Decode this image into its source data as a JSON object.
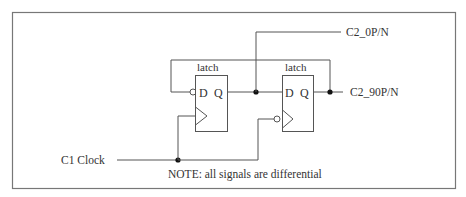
{
  "diagram": {
    "latch1": {
      "title": "latch",
      "pin_d": "D",
      "pin_q": "Q"
    },
    "latch2": {
      "title": "latch",
      "pin_d": "D",
      "pin_q": "Q"
    },
    "signals": {
      "clock_in": "C1 Clock",
      "out_0": "C2_0P/N",
      "out_90": "C2_90P/N"
    },
    "note": "NOTE: all signals are differential"
  }
}
